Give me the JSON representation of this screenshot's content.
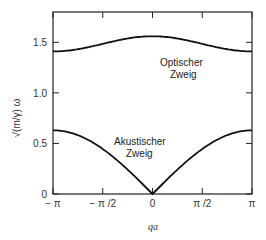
{
  "chart_data": {
    "type": "line",
    "title": "",
    "xlabel": "qa",
    "ylabel": "√(m/γ) ω",
    "xlim": [
      -3.14159,
      3.14159
    ],
    "ylim": [
      0,
      1.8
    ],
    "grid": false,
    "x_ticks": [
      "− π",
      "− π /2",
      "0",
      "π /2",
      "π"
    ],
    "y_ticks": [
      "0",
      "0.5",
      "1.0",
      "1.5"
    ],
    "series": [
      {
        "name": "Optischer Zweig",
        "x": [
          -3.14,
          -2.36,
          -1.57,
          -0.79,
          0,
          0.79,
          1.57,
          2.36,
          3.14
        ],
        "values": [
          1.41,
          1.43,
          1.48,
          1.53,
          1.56,
          1.53,
          1.48,
          1.43,
          1.41
        ]
      },
      {
        "name": "Akustischer Zweig",
        "x": [
          -3.14,
          -2.36,
          -1.57,
          -0.79,
          0,
          0.79,
          1.57,
          2.36,
          3.14
        ],
        "values": [
          0.63,
          0.58,
          0.45,
          0.24,
          0.0,
          0.24,
          0.45,
          0.58,
          0.63
        ]
      }
    ],
    "annotations": [
      {
        "text": "Optischer",
        "line2": "Zweig"
      },
      {
        "text": "Akustischer",
        "line2": "Zweig"
      }
    ]
  }
}
